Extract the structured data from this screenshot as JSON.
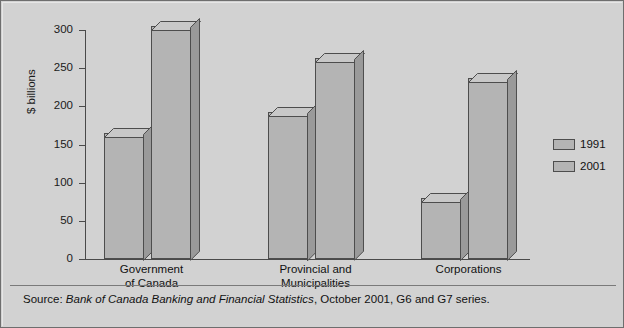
{
  "chart_data": {
    "type": "bar",
    "title": "",
    "subtitle": "",
    "xlabel": "",
    "ylabel": "$ billions",
    "ylim": [
      0,
      300
    ],
    "yticks": [
      0,
      50,
      100,
      150,
      200,
      250,
      300
    ],
    "ytick_labels": [
      "0",
      "50",
      "100",
      "150",
      "200",
      "250",
      "300"
    ],
    "grid": false,
    "legend_position": "right",
    "categories": [
      "Government\nof Canada",
      "Provincial and\nMunicipalities",
      "Corporations"
    ],
    "series": [
      {
        "name": "1991",
        "values": [
          165,
          193,
          80
        ]
      },
      {
        "name": "2001",
        "values": [
          305,
          263,
          237
        ]
      }
    ],
    "colors": {
      "bar_face": "#b4b4b4",
      "bar_top": "#c8c8c8",
      "bar_side": "#9a9a9a",
      "bar_outline": "#4d4d4d",
      "plot_background": "#d2d2d2",
      "axis": "#4a4a4a",
      "text": "#111111"
    },
    "source_note": {
      "prefix": "Source: ",
      "italic": "Bank of Canada Banking and Financial Statistics",
      "suffix": ", October 2001, G6 and G7 series."
    }
  },
  "legend": {
    "items": [
      {
        "label": "1991"
      },
      {
        "label": "2001"
      }
    ]
  }
}
